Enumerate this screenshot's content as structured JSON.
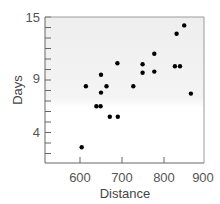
{
  "chart_data": {
    "type": "scatter",
    "title": "",
    "xlabel": "Distance",
    "ylabel": "Days",
    "xlim": [
      550,
      895
    ],
    "ylim": [
      1,
      15
    ],
    "x_ticks": [
      600,
      700,
      800,
      900
    ],
    "y_ticks": [
      4,
      9,
      15
    ],
    "y_minor_tick_step": 1,
    "grid": false,
    "legend": null,
    "background": "light grey gradient fading to white toward bottom",
    "marker_color": "#000000",
    "points": [
      {
        "x": 604,
        "y": 2.6
      },
      {
        "x": 614,
        "y": 8.4
      },
      {
        "x": 639,
        "y": 6.5
      },
      {
        "x": 649,
        "y": 6.5
      },
      {
        "x": 650,
        "y": 9.5
      },
      {
        "x": 650,
        "y": 7.8
      },
      {
        "x": 663,
        "y": 8.4
      },
      {
        "x": 671,
        "y": 5.5
      },
      {
        "x": 690,
        "y": 5.5
      },
      {
        "x": 689,
        "y": 10.6
      },
      {
        "x": 727,
        "y": 8.4
      },
      {
        "x": 749,
        "y": 10.5
      },
      {
        "x": 749,
        "y": 9.7
      },
      {
        "x": 777,
        "y": 11.5
      },
      {
        "x": 777,
        "y": 9.8
      },
      {
        "x": 826,
        "y": 10.3
      },
      {
        "x": 838,
        "y": 10.3
      },
      {
        "x": 830,
        "y": 13.4
      },
      {
        "x": 848,
        "y": 14.2
      },
      {
        "x": 864,
        "y": 7.7
      }
    ]
  },
  "labels": {
    "x_axis_title": "Distance",
    "y_axis_title": "Days",
    "x_tick_labels": [
      "600",
      "700",
      "800",
      "900"
    ],
    "y_tick_labels": [
      "15",
      "9",
      "4"
    ]
  }
}
